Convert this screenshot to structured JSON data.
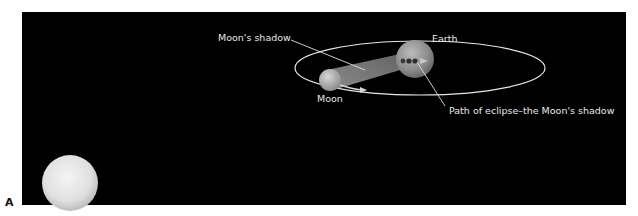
{
  "figure": {
    "panel_label": "A",
    "labels": {
      "moons_shadow": "Moon's shadow",
      "earth": "Earth",
      "moon": "Moon",
      "path_of_eclipse": "Path of eclipse–the Moon's shadow"
    },
    "colors": {
      "background": "#000000",
      "page": "#ffffff",
      "orbit": "#e6e6e6",
      "label_text": "#e8e8e8",
      "shadow_cone": "#8c8c8c",
      "sun": "#e4e4e4"
    },
    "bodies": {
      "sun": {
        "cx": 70,
        "cy": 183,
        "r": 28
      },
      "earth": {
        "cx": 415,
        "cy": 59,
        "r": 19
      },
      "moon": {
        "cx": 330,
        "cy": 80,
        "r": 11
      }
    },
    "orbit": {
      "cx": 420,
      "cy": 68,
      "rx": 125,
      "ry": 27
    }
  }
}
